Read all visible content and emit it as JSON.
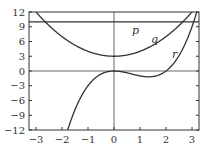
{
  "chart_data": {
    "type": "line",
    "title": "",
    "xlabel": "",
    "ylabel": "",
    "xlim": [
      -3.2,
      3.3
    ],
    "ylim": [
      -12,
      12
    ],
    "xticks": [
      -3,
      -2,
      -1,
      0,
      1,
      2,
      3
    ],
    "yticks": [
      12,
      9,
      6,
      3,
      0,
      -3,
      -6,
      -9,
      -12
    ],
    "grid": false,
    "series": [
      {
        "name": "p",
        "formula": "y = 10",
        "x": [
          -3.2,
          3.3
        ],
        "values": [
          10,
          10
        ]
      },
      {
        "name": "q",
        "formula": "y = x^2 + 3",
        "x": [
          -3,
          -2,
          -1,
          0,
          1,
          2,
          3
        ],
        "values": [
          12,
          7,
          4,
          3,
          4,
          7,
          12
        ]
      },
      {
        "name": "r",
        "formula": "y = x^3 - 2x^2",
        "x": [
          -1.8,
          -1,
          0,
          1,
          1.33,
          2,
          3,
          3.2
        ],
        "values": [
          -12.3,
          -3,
          0,
          -1,
          -1.19,
          0,
          9,
          12.3
        ]
      }
    ],
    "annotations": [
      {
        "text": "p",
        "x": 0.8,
        "y": 8.2
      },
      {
        "text": "q",
        "x": 1.8,
        "y": 6.4
      },
      {
        "text": "r",
        "x": 2.4,
        "y": 3.2
      }
    ]
  },
  "labels": {
    "x": [
      "-3",
      "-2",
      "-1",
      "0",
      "1",
      "2",
      "3"
    ],
    "y": [
      "12",
      "9",
      "6",
      "3",
      "0",
      "-3",
      "-6",
      "-9",
      "-12"
    ],
    "p": "p",
    "q": "q",
    "r": "r"
  }
}
